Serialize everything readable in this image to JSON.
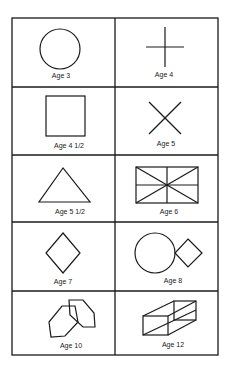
{
  "cells": [
    {
      "shape": "circle",
      "label": "Age 3"
    },
    {
      "shape": "cross",
      "label": "Age 4"
    },
    {
      "shape": "square",
      "label": "Age 4 1/2"
    },
    {
      "shape": "x-cross",
      "label": "Age 5"
    },
    {
      "shape": "triangle",
      "label": "Age 5 1/2"
    },
    {
      "shape": "divided-rectangle",
      "label": "Age 6"
    },
    {
      "shape": "diamond",
      "label": "Age 7"
    },
    {
      "shape": "circle-and-diamond",
      "label": "Age 8"
    },
    {
      "shape": "overlapping-hexagons",
      "label": "Age 10"
    },
    {
      "shape": "wireframe-box",
      "label": "Age 12"
    }
  ]
}
